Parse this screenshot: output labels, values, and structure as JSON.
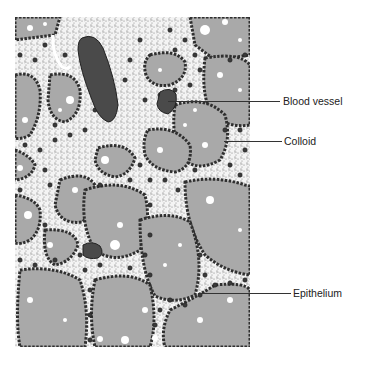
{
  "figure": {
    "labels": [
      {
        "id": "blood-vessel",
        "text": "Blood vessel",
        "x": 283,
        "y": 95,
        "line": {
          "x1": 168,
          "x2": 280,
          "y": 101
        }
      },
      {
        "id": "colloid",
        "text": "Colloid",
        "x": 284,
        "y": 135,
        "line": {
          "x1": 224,
          "x2": 282,
          "y": 141
        }
      },
      {
        "id": "epithelium",
        "text": "Epithelium",
        "x": 293,
        "y": 287,
        "line": {
          "x1": 200,
          "x2": 291,
          "y": 293
        }
      }
    ]
  },
  "colors": {
    "colloid": "#a9a9a9",
    "connective_tissue": "#f2f2f2",
    "nucleus": "#3a3a3a",
    "blood_vessel": "#4a4a4a",
    "leader_line": "#333333",
    "label_text": "#222222"
  }
}
